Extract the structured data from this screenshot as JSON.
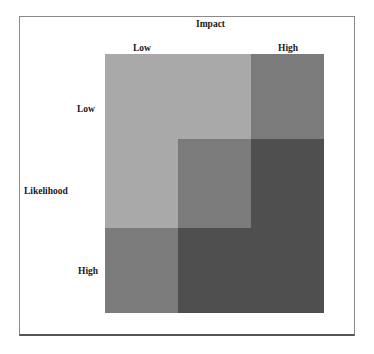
{
  "diagram": {
    "type": "risk-matrix",
    "x_axis_title": "Impact",
    "y_axis_title": "Likelihood",
    "x_labels": {
      "low": "Low",
      "high": "High"
    },
    "y_labels": {
      "low": "Low",
      "high": "High"
    },
    "colors": {
      "low_risk": "#a9a9a9",
      "medium_risk": "#7b7b7b",
      "high_risk": "#4f4f4f"
    },
    "grid": [
      [
        "low_risk",
        "low_risk",
        "medium_risk"
      ],
      [
        "low_risk",
        "medium_risk",
        "high_risk"
      ],
      [
        "medium_risk",
        "high_risk",
        "high_risk"
      ]
    ]
  }
}
